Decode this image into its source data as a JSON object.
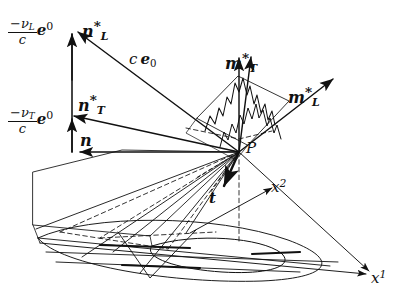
{
  "figure": {
    "type": "3d-vector-diagram",
    "background_color": "#ffffff",
    "ink_color": "#111111",
    "width": 411,
    "height": 305
  },
  "labels": {
    "nu_L_over_c_e0": {
      "minus": "−",
      "nu": "ν",
      "nu_sub": "L",
      "den": "c",
      "e": "e",
      "e_sup": "0"
    },
    "nu_T_over_c_e0": {
      "minus": "−",
      "nu": "ν",
      "nu_sub": "T",
      "den": "c",
      "e": "e",
      "e_sup": "0"
    },
    "n_star_L": {
      "base": "n",
      "star": "*",
      "sub": "L"
    },
    "n_star_T": {
      "base": "n",
      "star": "*",
      "sub": "T"
    },
    "n": {
      "base": "n"
    },
    "c_e0": {
      "c": "c",
      "e": "e",
      "sub": "0"
    },
    "m_star_T": {
      "base": "m",
      "star": "*",
      "sub": "T"
    },
    "m_star_L": {
      "base": "m",
      "star": "*",
      "sub": "L"
    },
    "t": {
      "base": "t"
    },
    "P": {
      "base": "P"
    },
    "x1": {
      "base": "x",
      "sup": "1"
    },
    "x2": {
      "base": "x",
      "sup": "2"
    }
  },
  "geometry": {
    "origin_P": [
      239,
      152
    ],
    "vector_tips": {
      "n_star_L": [
        66,
        23
      ],
      "n_star_T": [
        64,
        114
      ],
      "n": [
        72,
        152
      ],
      "c_e0": [
        178,
        55
      ],
      "m_star_T": [
        253,
        53
      ],
      "m_star_L": [
        336,
        76
      ],
      "t": [
        222,
        191
      ],
      "x1": [
        372,
        274
      ],
      "x2": [
        274,
        185
      ]
    },
    "axes": [
      "x1",
      "x2"
    ],
    "dashed_elements": [
      "hidden-cone-edges",
      "projection-lines",
      "vertical-drop-line"
    ]
  }
}
